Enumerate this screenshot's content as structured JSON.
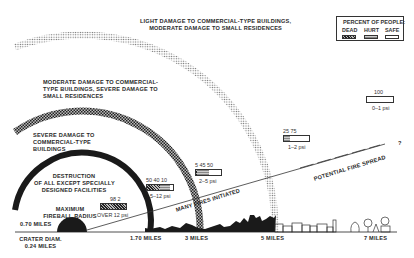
{
  "legend": {
    "title": "PERCENT OF PEOPLE:",
    "dead": "DEAD",
    "hurt": "HURT",
    "safe": "SAFE"
  },
  "zones": {
    "outer": "LIGHT DAMAGE TO COMMERCIAL-TYPE BUILDINGS,",
    "outer2": "MODERATE DAMAGE TO SMALL RESIDENCES",
    "third1": "MODERATE DAMAGE TO COMMERCIAL-",
    "third2": "TYPE BUILDINGS, SEVERE DAMAGE TO",
    "third3": "SMALL RESIDENCES",
    "second1": "SEVERE DAMAGE TO",
    "second2": "COMMERCIAL-TYPE",
    "second3": "BUILDINGS",
    "inner1": "DESTRUCTION",
    "inner2": "OF ALL EXCEPT SPECIALLY",
    "inner3": "DESIGNED FACILITIES",
    "fireball1": "MAXIMUM",
    "fireball2": "FIREBALL RADIUS",
    "fireball3": "0.70 MILES",
    "crater1": "CRATER DIAM.",
    "crater2": "0.24 MILES"
  },
  "bars": [
    {
      "values_label": "98   2",
      "psi": "OVER 12 psi",
      "dead": 98,
      "hurt": 2,
      "safe": 0
    },
    {
      "values_label": "50   40 10",
      "psi": "5–12 psi",
      "dead": 50,
      "hurt": 40,
      "safe": 10
    },
    {
      "values_label": "5  45  50",
      "psi": "2–5 psi",
      "dead": 5,
      "hurt": 45,
      "safe": 50
    },
    {
      "values_label": "25  75",
      "psi": "1–2 psi",
      "dead": 0,
      "hurt": 25,
      "safe": 75
    },
    {
      "values_label": "100",
      "psi": "0–1 psi",
      "dead": 0,
      "hurt": 0,
      "safe": 100
    }
  ],
  "distances": {
    "d1": "1.70 MILES",
    "d2": "3 MILES",
    "d3": "5 MILES",
    "d4": "7 MILES"
  },
  "fire": {
    "initiated": "MANY FIRES INITIATED",
    "spread": "POTENTIAL FIRE SPREAD",
    "question": "?"
  }
}
